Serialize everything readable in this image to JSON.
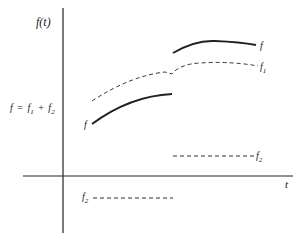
{
  "diagram": {
    "type": "function-decomposition-sketch",
    "y_axis_label": "f(t)",
    "x_axis_label": "t",
    "equation_label": {
      "lhs": "f",
      "equals": "=",
      "t1": "f",
      "s1": "1",
      "plus": "+",
      "t2": "f",
      "s2": "2"
    },
    "curves": [
      {
        "name": "f",
        "style": "solid",
        "segment": "left",
        "label": "f"
      },
      {
        "name": "f",
        "style": "solid",
        "segment": "right",
        "label": "f"
      },
      {
        "name": "f1",
        "style": "dashed",
        "segment": "continuous-with-kink",
        "label": "f",
        "label_sub": "1"
      },
      {
        "name": "f2",
        "style": "dashed",
        "segment": "left-negative-constant",
        "label": "f",
        "label_sub": "2"
      },
      {
        "name": "f2",
        "style": "dashed",
        "segment": "right-positive-constant",
        "label": "f",
        "label_sub": "2"
      }
    ],
    "colors": {
      "ink": "#222222",
      "background": "#ffffff"
    }
  }
}
